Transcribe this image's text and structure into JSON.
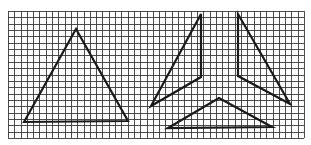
{
  "figure": {
    "background_color": "#ffffff",
    "line_color": "#1a1a1a",
    "grid_color": "#3a3a3a"
  },
  "grid": {
    "x0": 8,
    "y0": 11,
    "x1": 304,
    "y1": 138,
    "columns": 47,
    "rows": 20
  },
  "shapes": [
    {
      "name": "whole-triangle",
      "points": [
        [
          24,
          122
        ],
        [
          76,
          29
        ],
        [
          128,
          121
        ]
      ]
    },
    {
      "name": "piece-left",
      "points": [
        [
          201,
          14
        ],
        [
          201,
          77
        ],
        [
          151,
          106
        ]
      ]
    },
    {
      "name": "piece-right",
      "points": [
        [
          238,
          14
        ],
        [
          238,
          76
        ],
        [
          290,
          104
        ]
      ]
    },
    {
      "name": "piece-bottom",
      "points": [
        [
          168,
          128
        ],
        [
          219,
          98
        ],
        [
          272,
          127
        ]
      ]
    }
  ]
}
